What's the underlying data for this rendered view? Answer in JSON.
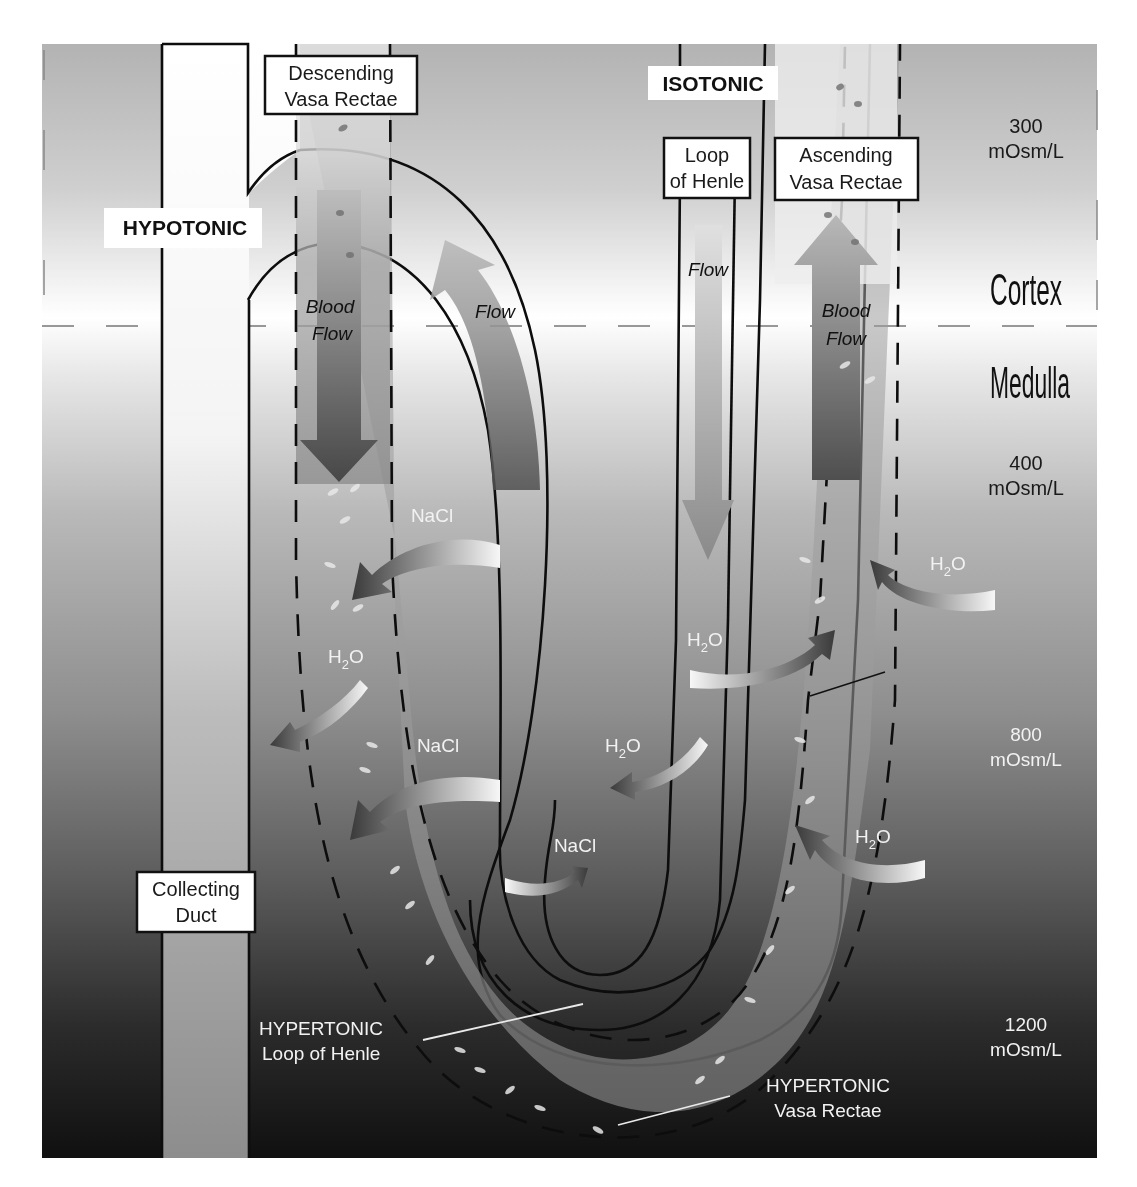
{
  "figure": {
    "domain": "renal physiology",
    "zones": {
      "cortex_label": "Cortex",
      "medulla_label": "Medulla"
    },
    "tonicity_tags": {
      "hypotonic": "HYPOTONIC",
      "isotonic": "ISOTONIC"
    },
    "osmolarity_scale": [
      {
        "value": "300",
        "unit": "mOsm/L"
      },
      {
        "value": "400",
        "unit": "mOsm/L"
      },
      {
        "value": "800",
        "unit": "mOsm/L"
      },
      {
        "value": "1200",
        "unit": "mOsm/L"
      }
    ],
    "structure_labels": {
      "descending_vasa_rectae": [
        "Descending",
        "Vasa Rectae"
      ],
      "ascending_vasa_rectae": [
        "Ascending",
        "Vasa Rectae"
      ],
      "loop_of_henle": [
        "Loop",
        "of Henle"
      ],
      "collecting_duct": [
        "Collecting",
        "Duct"
      ]
    },
    "flow_labels": {
      "descending_blood_flow": [
        "Blood",
        "Flow"
      ],
      "ascending_blood_flow": [
        "Blood",
        "Flow"
      ],
      "loop_flow_left": "Flow",
      "loop_flow_right": "Flow"
    },
    "exchange_labels": {
      "nacl_1": "NaCl",
      "h2o_1": "H",
      "nacl_2": "NaCl",
      "h2o_2": "H",
      "nacl_3": "NaCl",
      "h2o_3": "H",
      "h2o_4": "H",
      "h2o_5": "H",
      "subscript": "2",
      "oxygen": "O"
    },
    "bottom_labels": {
      "hypertonic_loop": [
        "HYPERTONIC",
        "Loop of Henle"
      ],
      "hypertonic_vasa": [
        "HYPERTONIC",
        "Vasa Rectae"
      ]
    },
    "colors": {
      "top_bg": "#c9c9c9",
      "cortex_medulla_band": "#f4f4f4",
      "mid_bg": "#8f8f8f",
      "bottom_bg": "#161616",
      "tube_fill": "#ffffff",
      "vasa_fill": "#9a9a9a",
      "arrow_dark": "#4a4a4a"
    }
  }
}
